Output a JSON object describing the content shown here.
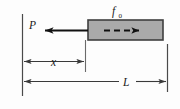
{
  "figure": {
    "type": "engineering-mechanics-diagram",
    "background_color": "#fdfdfd",
    "line_color": "#3a3a3a",
    "arrow_color": "#111111",
    "block": {
      "name": "block",
      "fill_color": "#aaaaaa",
      "border_color": "#3f3f3f",
      "x": 88,
      "y": 20,
      "width": 75,
      "height": 20
    },
    "labels": {
      "friction": {
        "text": "f",
        "subscript": "0",
        "x": 115,
        "y": 14
      },
      "force": {
        "text": "P",
        "x": 33,
        "y": 33
      },
      "distance_x": {
        "text": "x",
        "x": 54,
        "y": 66
      },
      "length_L": {
        "text": "L",
        "x": 127,
        "y": 86
      }
    },
    "dimensions": [
      {
        "name": "x",
        "label": "x",
        "from_x": 22,
        "to_x": 85,
        "y": 61
      },
      {
        "name": "L",
        "label": "L",
        "from_x": 22,
        "to_x": 168,
        "y": 81
      }
    ],
    "arrows": {
      "applied_force": {
        "name": "P-arrow",
        "direction": "left",
        "from_x": 88,
        "to_x": 45,
        "y": 30
      },
      "internal_motion": {
        "name": "dashed-arrow",
        "direction": "right",
        "from_x": 104,
        "to_x": 143,
        "y": 30,
        "style": "dashed"
      }
    }
  }
}
